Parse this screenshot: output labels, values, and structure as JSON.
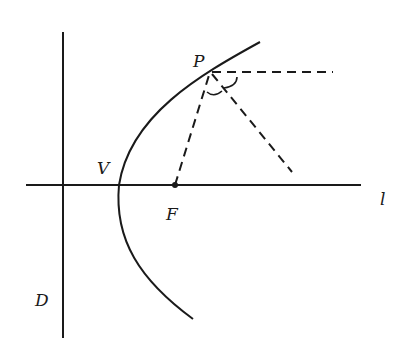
{
  "diagram": {
    "title": "",
    "labels": {
      "P": "P",
      "V": "V",
      "F": "F",
      "D": "D",
      "l": "l"
    },
    "elements": {
      "directrix": "D",
      "axis": "l",
      "vertex": "V",
      "focus": "F",
      "point_on_parabola": "P"
    },
    "colors": {
      "stroke": "#1a1a1a",
      "background": "#ffffff"
    }
  }
}
